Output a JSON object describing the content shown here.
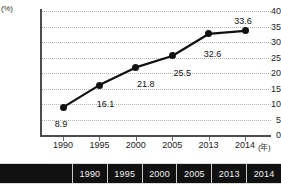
{
  "chart_data": {
    "type": "line",
    "title": "",
    "subtitle": "",
    "xlabel": "(年)",
    "ylabel": "(%)",
    "categories": [
      "1990",
      "1995",
      "2000",
      "2005",
      "2013",
      "2014"
    ],
    "values": [
      8.9,
      16.1,
      21.8,
      25.5,
      32.6,
      33.6
    ],
    "series": [
      {
        "name": "",
        "values": [
          8.9,
          16.1,
          21.8,
          25.5,
          32.6,
          33.6
        ]
      }
    ],
    "point_labels": [
      "8.9",
      "16.1",
      "21.8",
      "25.5",
      "32.6",
      "33.6"
    ],
    "ylim": [
      0,
      40
    ],
    "ytick_labels": [
      "0",
      "5",
      "10",
      "15",
      "20",
      "25",
      "30",
      "35",
      "40"
    ],
    "ytick_values": [
      0,
      5,
      10,
      15,
      20,
      25,
      30,
      35,
      40
    ],
    "xtick_labels": [
      "1990",
      "1995",
      "2000",
      "2005",
      "2013",
      "2014"
    ],
    "grid": true,
    "grid_style": "dotted-horizontal",
    "legend": "none",
    "marker": "filled-circle",
    "line_color": "#111111",
    "marker_color": "#111111",
    "grid_color": "#b4b4b4",
    "axis_color": "#4d4d4d"
  },
  "axis": {
    "y_unit": "(%)",
    "x_unit": "(年)"
  },
  "year_table": {
    "blank_label": "",
    "cells": [
      "1990",
      "1995",
      "2000",
      "2005",
      "2013",
      "2014"
    ],
    "background": "#111111",
    "text_color": "#f2f2f2"
  }
}
